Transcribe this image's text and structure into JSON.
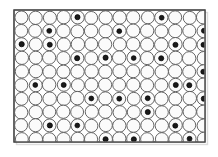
{
  "figure": {
    "title": "Interstitial solid solution lattice diagram",
    "canvas": {
      "width": 218,
      "height": 157
    },
    "frame": {
      "x": 14,
      "y": 10,
      "width": 191,
      "height": 132,
      "stroke": "#4a4a4a",
      "stroke_width": 1.2,
      "fill": "#ffffff"
    },
    "colors": {
      "background": "#ffffff",
      "frame_stroke": "#4a4a4a",
      "host_circle_fill": "#fbfbfb",
      "host_circle_stroke": "#555555",
      "interstitial_fill": "#1a1a1a",
      "interstitial_stroke": "#000000",
      "shadow": "#d8d8d8"
    },
    "lattice": {
      "type": "square",
      "columns": 14,
      "rows": 10,
      "spacing_x": 14.0,
      "spacing_y": 13.5,
      "origin_x": 21.5,
      "origin_y": 17.5,
      "host_radius": 6.6,
      "host_stroke_width": 0.9,
      "interstitial_radius": 2.5,
      "interstitial_stroke_width": 0.7
    },
    "legend": {
      "host_label": "host atom",
      "interstitial_label": "interstitial atom"
    }
  },
  "chart_data": {
    "type": "scatter",
    "title": "Interstitial solid solution lattice diagram",
    "subtitle": "",
    "xlabel": "",
    "ylabel": "",
    "grid": false,
    "legend_position": "none",
    "xlim": [
      0,
      14
    ],
    "ylim": [
      0,
      10
    ],
    "series": [
      {
        "name": "host atoms",
        "marker": "open-circle",
        "marker_radius": 6.6,
        "fill": "#fbfbfb",
        "stroke": "#555555",
        "count": 140,
        "description": "14 columns by 10 rows of large open circles on a square lattice, touching neighbours"
      },
      {
        "name": "interstitial atoms",
        "marker": "filled-circle",
        "marker_radius": 2.5,
        "fill": "#1a1a1a",
        "stroke": "#000000",
        "count": 56,
        "description": "small black dots at interstitial (corner) sites between four host circles",
        "points": [
          [
            4,
            0
          ],
          [
            10,
            0
          ],
          [
            2,
            1
          ],
          [
            7,
            1
          ],
          [
            13,
            1
          ],
          [
            0,
            2
          ],
          [
            2,
            2
          ],
          [
            11,
            2
          ],
          [
            13,
            2
          ],
          [
            4,
            3
          ],
          [
            6,
            3
          ],
          [
            8,
            3
          ],
          [
            10,
            3
          ],
          [
            13,
            4
          ],
          [
            1,
            5
          ],
          [
            3,
            5
          ],
          [
            11,
            5
          ],
          [
            12,
            5
          ],
          [
            5,
            6
          ],
          [
            7,
            6
          ],
          [
            9,
            6
          ],
          [
            13,
            6
          ],
          [
            9,
            7
          ],
          [
            2,
            8
          ],
          [
            4,
            8
          ],
          [
            11,
            8
          ],
          [
            6,
            9
          ],
          [
            8,
            9
          ],
          [
            12,
            9
          ],
          [
            0,
            10
          ],
          [
            10,
            10
          ],
          [
            5,
            11
          ],
          [
            10,
            11
          ]
        ]
      }
    ]
  }
}
